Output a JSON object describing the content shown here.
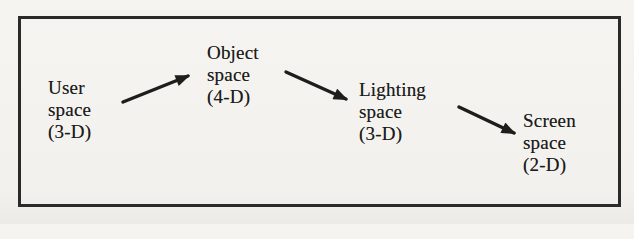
{
  "figure": {
    "description_type": "flow-diagram",
    "nodes": [
      {
        "id": "user-space",
        "label": "User\nspace\n(3-D)"
      },
      {
        "id": "object-space",
        "label": "Object\nspace\n(4-D)"
      },
      {
        "id": "lighting-space",
        "label": "Lighting\nspace\n(3-D)"
      },
      {
        "id": "screen-space",
        "label": "Screen\nspace\n(2-D)"
      }
    ],
    "edges": [
      {
        "from": "user-space",
        "to": "object-space"
      },
      {
        "from": "object-space",
        "to": "lighting-space"
      },
      {
        "from": "lighting-space",
        "to": "screen-space"
      }
    ],
    "colors": {
      "ink": "#1c1c1c",
      "paper": "#f4f3ef",
      "border": "#2b2a28"
    }
  }
}
